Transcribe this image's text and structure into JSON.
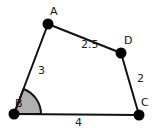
{
  "diagram": {
    "type": "quadrilateral",
    "points": {
      "A": {
        "label": "A",
        "x": 48,
        "y": 24
      },
      "B": {
        "label": "B",
        "x": 14,
        "y": 114
      },
      "C": {
        "label": "C",
        "x": 139,
        "y": 115
      },
      "D": {
        "label": "D",
        "x": 121,
        "y": 53
      }
    },
    "sides": {
      "AB": {
        "label": "3"
      },
      "BC": {
        "label": "4"
      },
      "CD": {
        "label": "2"
      },
      "DA": {
        "label": "2.5"
      }
    },
    "marked_angle": {
      "vertex": "B",
      "fill": "#b0b0b0"
    },
    "colors": {
      "line": "#111111",
      "point": "#000000",
      "background": "#ffffff"
    }
  }
}
